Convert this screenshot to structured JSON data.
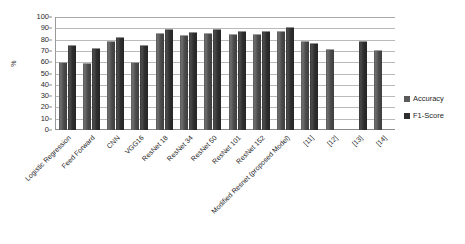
{
  "chart_data": {
    "type": "bar",
    "title": "",
    "xlabel": "",
    "ylabel": "%",
    "ylim": [
      0,
      100
    ],
    "ytick_step": 10,
    "yticks": [
      "100",
      "90",
      "80",
      "70",
      "60",
      "50",
      "40",
      "30",
      "20",
      "10",
      "0"
    ],
    "grid": true,
    "legend_position": "right",
    "categories": [
      "Logistic Regression",
      "Feed Forward",
      "CNN",
      "VGG16",
      "ResNet 18",
      "ResNet 34",
      "ResNet 50",
      "ResNet 101",
      "ResNet 152",
      "Modified Resnet (proposed Model)",
      "[11]",
      "[12]",
      "[13]",
      "[14]"
    ],
    "series": [
      {
        "name": "Accuracy",
        "color": "#5a5a5a",
        "values": [
          60,
          59,
          79,
          60,
          86,
          84,
          86,
          85,
          85,
          88,
          79,
          72,
          null,
          71
        ]
      },
      {
        "name": "F1-Score",
        "color": "#2e2e2e",
        "values": [
          75,
          73,
          82,
          75,
          89,
          87,
          89,
          88,
          88,
          91,
          77,
          null,
          79,
          null
        ]
      }
    ]
  },
  "legend": {
    "items": [
      {
        "label": "Accuracy",
        "swatch": "accuracy-swatch"
      },
      {
        "label": "F1-Score",
        "swatch": "f1-score-swatch"
      }
    ]
  },
  "axis": {
    "y_title": "%"
  }
}
